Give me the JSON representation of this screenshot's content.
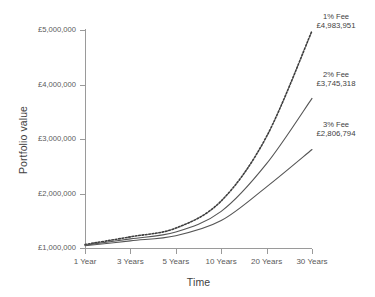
{
  "chart_data": {
    "type": "line",
    "title": "",
    "xlabel": "Time",
    "ylabel": "Portfolio value",
    "categories": [
      "1 Year",
      "3 Years",
      "5 Years",
      "10 Years",
      "20 Years",
      "30 Years"
    ],
    "x_numeric": [
      1,
      3,
      5,
      10,
      20,
      30
    ],
    "ylim": [
      1000000,
      5000000
    ],
    "ytick_labels": [
      "£1,000,000",
      "£2,000,000",
      "£3,000,000",
      "£4,000,000",
      "£5,000,000"
    ],
    "ytick_values": [
      1000000,
      2000000,
      3000000,
      4000000,
      5000000
    ],
    "grid": false,
    "legend_position": "inline-right-annotations",
    "series": [
      {
        "name": "1% Fee",
        "end_label": "£4,983,951",
        "end_value": 4983951,
        "style": "dotted",
        "color": "#3d3d3d",
        "values": [
          1064000,
          1205000,
          1365000,
          1863000,
          3047000,
          4983951
        ]
      },
      {
        "name": "2% Fee",
        "end_label": "£3,745,318",
        "end_value": 3745318,
        "style": "solid",
        "color": "#555555",
        "values": [
          1053000,
          1167000,
          1293000,
          1672000,
          2547000,
          3745318
        ]
      },
      {
        "name": "3% Fee",
        "end_label": "£2,806,794",
        "end_value": 2806794,
        "style": "solid",
        "color": "#555555",
        "values": [
          1042000,
          1131000,
          1226000,
          1503000,
          2122000,
          2806794
        ]
      }
    ]
  }
}
